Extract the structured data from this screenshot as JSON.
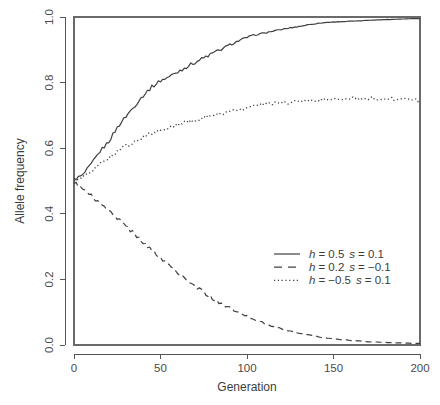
{
  "chart_data": {
    "type": "line",
    "title": "",
    "xlabel": "Generation",
    "ylabel": "Allele frequency",
    "xlim": [
      0,
      200
    ],
    "ylim": [
      0.0,
      1.0
    ],
    "xticks": [
      0,
      50,
      100,
      150,
      200
    ],
    "xtick_labels": [
      "0",
      "50",
      "100",
      "150",
      "200"
    ],
    "yticks": [
      0.0,
      0.2,
      0.4,
      0.6,
      0.8,
      1.0
    ],
    "ytick_labels": [
      "0.0",
      "0.2",
      "0.4",
      "0.6",
      "0.8",
      "1.0"
    ],
    "grid": false,
    "legend_position": "center-right",
    "line_color": "#404040",
    "x": [
      0,
      5,
      10,
      15,
      20,
      25,
      30,
      35,
      40,
      45,
      50,
      55,
      60,
      65,
      70,
      75,
      80,
      85,
      90,
      95,
      100,
      105,
      110,
      115,
      120,
      125,
      130,
      135,
      140,
      145,
      150,
      155,
      160,
      165,
      170,
      175,
      180,
      185,
      190,
      195,
      200
    ],
    "series": [
      {
        "name": "h = 0.5 s = 0.1",
        "label_h": "h",
        "label_h_value": "= 0.5",
        "label_s": "s",
        "label_s_value": "= 0.1",
        "style": "solid",
        "values": [
          0.505,
          0.517,
          0.551,
          0.59,
          0.62,
          0.663,
          0.697,
          0.729,
          0.761,
          0.787,
          0.806,
          0.818,
          0.833,
          0.848,
          0.862,
          0.875,
          0.889,
          0.901,
          0.915,
          0.927,
          0.938,
          0.946,
          0.951,
          0.957,
          0.962,
          0.967,
          0.971,
          0.976,
          0.98,
          0.983,
          0.985,
          0.986,
          0.987,
          0.988,
          0.99,
          0.991,
          0.992,
          0.993,
          0.994,
          0.995,
          0.995
        ]
      },
      {
        "name": "h = 0.2 s = -0.1",
        "label_h": "h",
        "label_h_value": "= 0.2",
        "label_s": "s",
        "label_s_value": "= −0.1",
        "style": "dashed",
        "values": [
          0.495,
          0.478,
          0.455,
          0.432,
          0.409,
          0.386,
          0.362,
          0.338,
          0.314,
          0.29,
          0.266,
          0.243,
          0.221,
          0.2,
          0.18,
          0.161,
          0.143,
          0.127,
          0.112,
          0.099,
          0.087,
          0.076,
          0.066,
          0.057,
          0.049,
          0.042,
          0.036,
          0.031,
          0.026,
          0.022,
          0.019,
          0.016,
          0.014,
          0.012,
          0.01,
          0.009,
          0.008,
          0.007,
          0.006,
          0.005,
          0.005
        ]
      },
      {
        "name": "h = -0.5 s = 0.1",
        "label_h": "h",
        "label_h_value": "= −0.5",
        "label_s": "s",
        "label_s_value": "= 0.1",
        "style": "dotted",
        "values": [
          0.5,
          0.511,
          0.531,
          0.551,
          0.571,
          0.59,
          0.607,
          0.621,
          0.634,
          0.645,
          0.655,
          0.663,
          0.671,
          0.679,
          0.686,
          0.693,
          0.7,
          0.706,
          0.712,
          0.717,
          0.723,
          0.731,
          0.734,
          0.736,
          0.738,
          0.74,
          0.743,
          0.746,
          0.748,
          0.749,
          0.75,
          0.75,
          0.751,
          0.751,
          0.752,
          0.751,
          0.75,
          0.749,
          0.748,
          0.748,
          0.747
        ]
      }
    ]
  }
}
